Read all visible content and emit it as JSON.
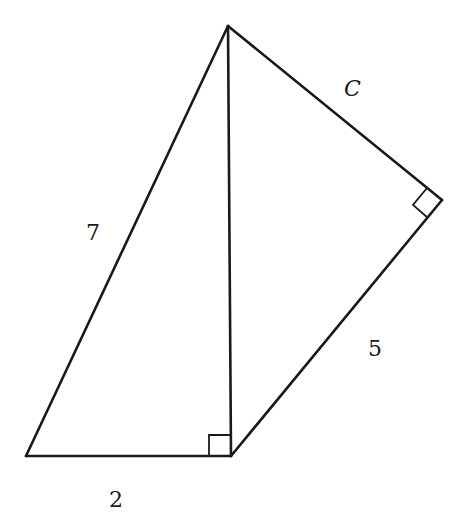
{
  "diagram": {
    "type": "geometry",
    "colors": {
      "stroke": "#1a1a1a",
      "background": "#ffffff"
    },
    "vertices": {
      "top": [
        228,
        26
      ],
      "bottom_left": [
        26,
        456
      ],
      "bottom_right": [
        231,
        456
      ],
      "right": [
        442,
        200
      ]
    },
    "labels": {
      "hypotenuse_left": "7",
      "base": "2",
      "side_right_lower": "5",
      "side_right_upper": "C"
    },
    "right_angles": [
      "bottom_right",
      "right"
    ]
  }
}
